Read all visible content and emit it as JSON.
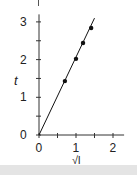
{
  "chart_data": {
    "type": "scatter",
    "title": "",
    "xlabel": "√l",
    "ylabel": "t",
    "xlim": [
      0,
      2.3
    ],
    "ylim": [
      0,
      3.2
    ],
    "x_ticks": [
      "0",
      "1",
      "2"
    ],
    "y_ticks": [
      "0",
      "1",
      "2",
      "3"
    ],
    "grid": false,
    "series": [
      {
        "name": "measurements",
        "marker": "dot",
        "x": [
          0.7,
          1.0,
          1.19,
          1.41
        ],
        "y": [
          1.43,
          2.02,
          2.44,
          2.84
        ]
      },
      {
        "name": "fit line",
        "style": "line",
        "x": [
          0,
          1.5
        ],
        "y": [
          0,
          3.1
        ]
      }
    ],
    "colors": {
      "axis": "#333333",
      "data": "#111111",
      "background": "#ffffff",
      "footer_band": "#e4e4e4"
    }
  },
  "axes": {
    "x_label": "√l",
    "y_label": "t"
  }
}
